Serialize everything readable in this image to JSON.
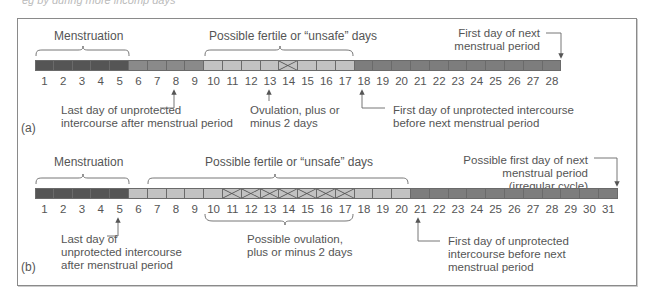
{
  "colors": {
    "menstruation": "#555555",
    "safe": "#8a8a8a",
    "fertile": "#c2c2c2",
    "after": "#7d7d7d",
    "line": "#555555"
  },
  "caption_fragment": "eg by during more incomp days",
  "panel_a": {
    "label": "(a)",
    "days": [
      "1",
      "2",
      "3",
      "4",
      "5",
      "6",
      "7",
      "8",
      "9",
      "10",
      "11",
      "12",
      "13",
      "14",
      "15",
      "16",
      "17",
      "18",
      "19",
      "20",
      "21",
      "22",
      "23",
      "24",
      "25",
      "26",
      "27",
      "28"
    ],
    "menstruation_label": "Menstruation",
    "fertile_label": "Possible fertile or “unsafe” days",
    "next_period_line1": "First day of next",
    "next_period_line2": "menstrual period",
    "last_day_line1": "Last day of unprotected",
    "last_day_line2": "intercourse after menstrual period",
    "ovulation_line1": "Ovulation, plus or",
    "ovulation_line2": "minus 2 days",
    "first_day_line1": "First day of unprotected intercourse",
    "first_day_line2": "before next menstrual period"
  },
  "panel_b": {
    "label": "(b)",
    "days": [
      "1",
      "2",
      "3",
      "4",
      "5",
      "6",
      "7",
      "8",
      "9",
      "10",
      "11",
      "12",
      "13",
      "14",
      "15",
      "16",
      "17",
      "18",
      "19",
      "20",
      "21",
      "22",
      "23",
      "24",
      "25",
      "26",
      "27",
      "28",
      "29",
      "30",
      "31"
    ],
    "menstruation_label": "Menstruation",
    "fertile_label": "Possible fertile or “unsafe” days",
    "next_period_line1": "Possible first day of next",
    "next_period_line2": "menstrual period",
    "next_period_line3": "(irregular cycle)",
    "last_day_line1": "Last day of",
    "last_day_line2": "unprotected intercourse",
    "last_day_line3": "after menstrual period",
    "ovulation_line1": "Possible ovulation,",
    "ovulation_line2": "plus or minus 2 days",
    "first_day_line1": "First day of unprotected",
    "first_day_line2": "intercourse before next",
    "first_day_line3": "menstrual period"
  }
}
